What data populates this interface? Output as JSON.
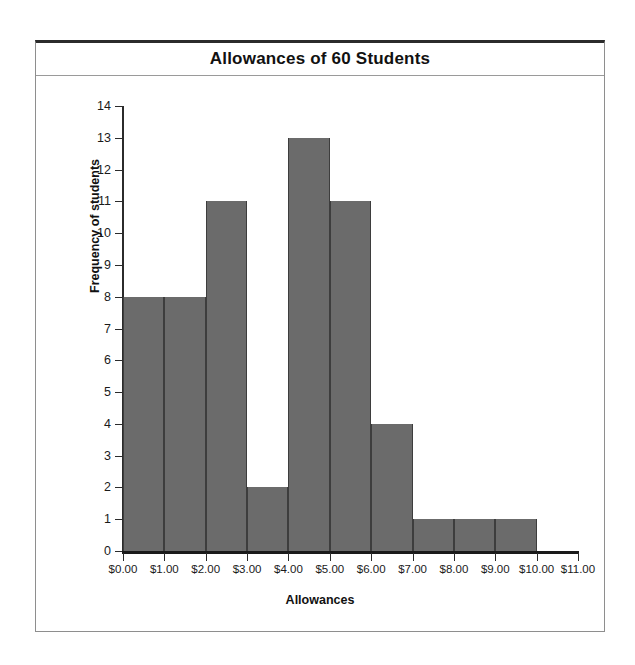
{
  "figure": {
    "title": "Allowances of 60 Students"
  },
  "chart_data": {
    "type": "bar",
    "title": "Allowances of 60 Students",
    "xlabel": "Allowances",
    "ylabel": "Frequency of students",
    "grid": false,
    "legend": "none",
    "xlim": [
      0,
      11
    ],
    "ylim": [
      0,
      14
    ],
    "bin_width": 1,
    "bin_edges": [
      0,
      1,
      2,
      3,
      4,
      5,
      6,
      7,
      8,
      9,
      10,
      11
    ],
    "x_tick_labels": [
      "$0.00",
      "$1.00",
      "$2.00",
      "$3.00",
      "$4.00",
      "$5.00",
      "$6.00",
      "$7.00",
      "$8.00",
      "$9.00",
      "$10.00",
      "$11.00"
    ],
    "y_tick_labels": [
      "0",
      "1",
      "2",
      "3",
      "4",
      "5",
      "6",
      "7",
      "8",
      "9",
      "10",
      "11",
      "12",
      "13",
      "14"
    ],
    "y_ticks": [
      0,
      1,
      2,
      3,
      4,
      5,
      6,
      7,
      8,
      9,
      10,
      11,
      12,
      13,
      14
    ],
    "categories": [
      "$0.00-$1.00",
      "$1.00-$2.00",
      "$2.00-$3.00",
      "$3.00-$4.00",
      "$4.00-$5.00",
      "$5.00-$6.00",
      "$6.00-$7.00",
      "$7.00-$8.00",
      "$8.00-$9.00",
      "$9.00-$10.00",
      "$10.00-$11.00"
    ],
    "values": [
      8,
      8,
      11,
      2,
      13,
      11,
      4,
      1,
      1,
      1,
      0
    ],
    "total": 60,
    "bar_color": "#6b6b6b",
    "bar_edge_color": "#3d3d3d",
    "axis_color": "#1a1a1a",
    "background_color": "#ffffff"
  }
}
